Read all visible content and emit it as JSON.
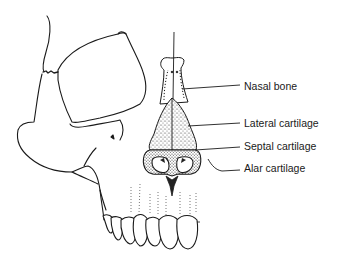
{
  "figure": {
    "ink_color": "#1a1a1a",
    "stipple_color": "#555555",
    "labels": [
      {
        "id": "nasal-bone",
        "text": "Nasal bone"
      },
      {
        "id": "lateral-cartilage",
        "text": "Lateral cartilage"
      },
      {
        "id": "septal-cartilage",
        "text": "Septal cartilage"
      },
      {
        "id": "alar-cartilage",
        "text": "Alar cartilage"
      }
    ]
  }
}
